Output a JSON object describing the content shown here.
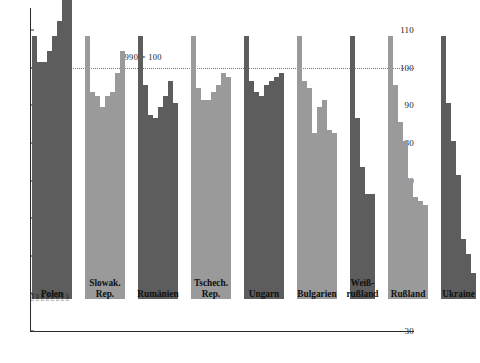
{
  "chart_data": {
    "type": "bar",
    "title": "",
    "annotation": "1990 = 100",
    "xlabel": "",
    "ylabel": "",
    "ylim": [
      30,
      117
    ],
    "yticks": [
      30,
      40,
      50,
      60,
      70,
      80,
      90,
      100,
      110
    ],
    "ytick_labels": [
      "30",
      "40",
      "50",
      "60",
      "70",
      "80",
      "90",
      "100",
      "110"
    ],
    "grid": false,
    "reference_line": {
      "value": 100,
      "label": "1990 = 100",
      "style": "dotted"
    },
    "legend": "none",
    "series_note": "Index of real GDP, 1990 = 100, by year within each country group",
    "categories": [
      "Polen",
      "Slowak. Rep.",
      "Rumänien",
      "Tschech. Rep.",
      "Ungarn",
      "Bulgarien",
      "Weiß-rußland",
      "Rußland",
      "Ukraine"
    ],
    "groups": [
      {
        "name": "Polen",
        "label": "Polen",
        "shade": "dark",
        "years": [
          "1990",
          "1991",
          "1992",
          "1993",
          "1994",
          "1995",
          "1996",
          "1997"
        ],
        "values": [
          100,
          93,
          93,
          96,
          100,
          104,
          110,
          116
        ]
      },
      {
        "name": "Slowak. Rep.",
        "label": "Slowak.\nRep.",
        "shade": "light",
        "years": [
          "1990",
          "1991",
          "1992",
          "1993",
          "1994",
          "1995",
          "1996",
          "1997"
        ],
        "values": [
          100,
          85,
          84,
          81,
          84,
          85,
          90,
          96
        ]
      },
      {
        "name": "Rumänien",
        "label": "Rumänien",
        "shade": "dark",
        "years": [
          "1990",
          "1991",
          "1992",
          "1993",
          "1994",
          "1995",
          "1996",
          "1997"
        ],
        "values": [
          100,
          87,
          79,
          78,
          81,
          84,
          88,
          82
        ]
      },
      {
        "name": "Tschech. Rep.",
        "label": "Tschech.\nRep.",
        "shade": "light",
        "years": [
          "1990",
          "1991",
          "1992",
          "1993",
          "1994",
          "1995",
          "1996",
          "1997"
        ],
        "values": [
          100,
          86,
          83,
          83,
          85,
          87,
          90,
          89
        ]
      },
      {
        "name": "Ungarn",
        "label": "Ungarn",
        "shade": "dark",
        "years": [
          "1990",
          "1991",
          "1992",
          "1993",
          "1994",
          "1995",
          "1996",
          "1997"
        ],
        "values": [
          100,
          88,
          85,
          84,
          87,
          88,
          89,
          90
        ]
      },
      {
        "name": "Bulgarien",
        "label": "Bulgarien",
        "shade": "light",
        "years": [
          "1990",
          "1991",
          "1992",
          "1993",
          "1994",
          "1995",
          "1996",
          "1997"
        ],
        "values": [
          100,
          88,
          86,
          74,
          81,
          83,
          75,
          74
        ]
      },
      {
        "name": "Weiß-rußland",
        "label": "Weiß-\nrußland",
        "shade": "dark",
        "years": [
          "1990",
          "1991",
          "1992",
          "1993",
          "1994"
        ],
        "values": [
          100,
          78,
          65,
          58,
          58
        ]
      },
      {
        "name": "Rußland",
        "label": "Rußland",
        "shade": "light",
        "years": [
          "1990",
          "1991",
          "1992",
          "1993",
          "1994",
          "1995",
          "1996",
          "1997"
        ],
        "values": [
          100,
          87,
          77,
          72,
          62,
          57,
          56,
          55
        ]
      },
      {
        "name": "Ukraine",
        "label": "Ukraine",
        "shade": "dark",
        "years": [
          "1990",
          "1991",
          "1992",
          "1993",
          "1994",
          "1995",
          "1996"
        ],
        "values": [
          100,
          82,
          72,
          63,
          46,
          42,
          37
        ]
      }
    ]
  },
  "colors": {
    "bar_dark": "#5d5d5d",
    "bar_light": "#9a9a9a",
    "axis": "#2b2b2b",
    "reference_line": "#7a7a7a",
    "background": "#ffffff"
  }
}
